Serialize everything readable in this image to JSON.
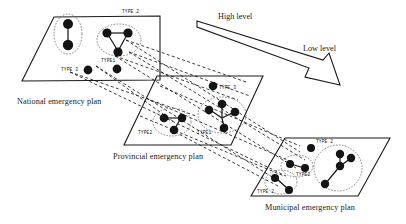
{
  "figure": {
    "background": "#ffffff",
    "ink": "#141414"
  },
  "levels": {
    "high_label": "High level",
    "low_label": "Low level"
  },
  "planes": [
    {
      "id": "national",
      "caption": "National emergency plan",
      "clusters": [
        {
          "label": "",
          "type": "TYPE2",
          "nodes": 2
        },
        {
          "label": "TYPE 2",
          "type": "TYPE2",
          "nodes": 3
        },
        {
          "label": "TYPE1",
          "type": "TYPE1",
          "nodes": 3
        },
        {
          "label": "TYPE 3",
          "type": "TYPE3",
          "nodes": 1
        }
      ]
    },
    {
      "id": "provincial",
      "caption": "Provincial emergency plan",
      "clusters": [
        {
          "label": "TYPE2",
          "type": "TYPE2",
          "nodes": 3
        },
        {
          "label": "TYPE1",
          "type": "TYPE1",
          "nodes": 4
        },
        {
          "label": "TYPE 3",
          "type": "TYPE3",
          "nodes": 1
        }
      ]
    },
    {
      "id": "municipal",
      "caption": "Municipal emergency plan",
      "clusters": [
        {
          "label": "TYPE2",
          "type": "TYPE2",
          "nodes": 2
        },
        {
          "label": "TYPE 2",
          "type": "TYPE2",
          "nodes": 2
        },
        {
          "label": "TYPE1",
          "type": "TYPE1",
          "nodes": 4
        },
        {
          "label": "TYPE 3",
          "type": "TYPE3",
          "nodes": 1
        }
      ]
    }
  ],
  "type_labels": {
    "national_top_right": "TYPE 2",
    "national_type1": "TYPE1",
    "national_type3": "TYPE 3",
    "provincial_type2": "TYPE2",
    "provincial_type1": "TYPE1",
    "provincial_type3": "TYPE 3",
    "municipal_type2_a": "TYPE2",
    "municipal_type2_b": "TYPE 2",
    "municipal_type3": "TYPE 2"
  }
}
